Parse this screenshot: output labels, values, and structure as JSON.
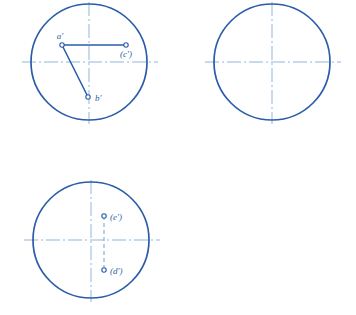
{
  "figure": {
    "stroke_colors": {
      "circle": "#2a5ca8",
      "centerline": "#8fb5dd",
      "solid_line": "#2a5ca8",
      "dashed_line": "#7fa8d8",
      "label": "#2a5ca8",
      "marker_fill": "#ffffff"
    },
    "background": "#ffffff"
  },
  "views": [
    {
      "id": "view-1",
      "name": "top-left-view",
      "circle": {
        "cx": 89,
        "cy": 62,
        "r": 58
      },
      "centerline_h": {
        "x1": 22,
        "y1": 62,
        "x2": 158,
        "y2": 62
      },
      "centerline_v": {
        "x1": 89,
        "y1": 2,
        "x2": 89,
        "y2": 124
      },
      "points": [
        {
          "key": "a",
          "label": "a'",
          "x": 62,
          "y": 45,
          "label_x": 60,
          "label_y": 39,
          "anchor": "middle"
        },
        {
          "key": "c",
          "label": "(c')",
          "x": 126,
          "y": 45,
          "label_x": 126,
          "label_y": 57,
          "anchor": "middle"
        },
        {
          "key": "b",
          "label": "b'",
          "x": 88,
          "y": 97,
          "label_x": 95,
          "label_y": 101,
          "anchor": "start"
        }
      ],
      "segments": [
        {
          "name": "segment-a-c",
          "x1": 62,
          "y1": 45,
          "x2": 126,
          "y2": 45,
          "style": "solid"
        },
        {
          "name": "segment-a-b",
          "x1": 62,
          "y1": 45,
          "x2": 88,
          "y2": 97,
          "style": "solid"
        }
      ]
    },
    {
      "id": "view-2",
      "name": "top-right-view",
      "circle": {
        "cx": 272,
        "cy": 62,
        "r": 58
      },
      "centerline_h": {
        "x1": 205,
        "y1": 62,
        "x2": 341,
        "y2": 62
      },
      "centerline_v": {
        "x1": 272,
        "y1": 2,
        "x2": 272,
        "y2": 124
      },
      "points": [],
      "segments": []
    },
    {
      "id": "view-3",
      "name": "bottom-left-view",
      "circle": {
        "cx": 91,
        "cy": 240,
        "r": 58
      },
      "centerline_h": {
        "x1": 24,
        "y1": 240,
        "x2": 160,
        "y2": 240
      },
      "centerline_v": {
        "x1": 91,
        "y1": 180,
        "x2": 91,
        "y2": 302
      },
      "points": [
        {
          "key": "e",
          "label": "(e')",
          "x": 104,
          "y": 216,
          "label_x": 110,
          "label_y": 220,
          "anchor": "start"
        },
        {
          "key": "d",
          "label": "(d')",
          "x": 104,
          "y": 270,
          "label_x": 110,
          "label_y": 274,
          "anchor": "start"
        }
      ],
      "segments": [
        {
          "name": "segment-e-d",
          "x1": 104,
          "y1": 216,
          "x2": 104,
          "y2": 270,
          "style": "dashed"
        }
      ]
    }
  ]
}
